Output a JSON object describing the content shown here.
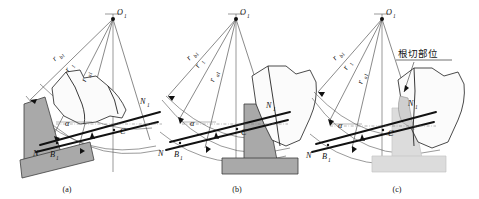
{
  "figure": {
    "background_color": "#ffffff",
    "width": 479,
    "height": 199
  },
  "colors": {
    "rack_dark_fill": "#a9a9a9",
    "rack_light_fill": "#dcdcdc",
    "gear_fill": "#fbfbfb",
    "undercut_fill": "#cfcfcf",
    "line": "#333333",
    "heavy_line": "#111111"
  },
  "captions": [
    {
      "id": "a",
      "text": "(a)"
    },
    {
      "id": "b",
      "text": "(b)"
    },
    {
      "id": "c",
      "text": "(c)"
    }
  ],
  "labels": {
    "center": "O",
    "center_sub": "1",
    "radius_base": "r",
    "radius_base_sub": "b1",
    "radius_pitch": "r",
    "radius_pitch_sub": "1",
    "radius_addendum": "r",
    "radius_addendum_sub": "a1",
    "point_N1": "N",
    "point_N1_sub": "1",
    "point_C": "C",
    "point_N": "N",
    "point_B1": "B",
    "point_B1_sub": "1",
    "angle_alpha": "α"
  },
  "annotation": {
    "undercut_text": "根切部位",
    "undercut_meaning": "undercut region"
  },
  "panels": [
    {
      "id": "a",
      "caption": "(a)",
      "center_label": "O1",
      "rack_shade": "dark",
      "rack_position": "left",
      "radii": [
        "rb1",
        "r1",
        "ra1"
      ],
      "points": [
        "O1",
        "N1",
        "C",
        "N",
        "B1"
      ],
      "angle": "α",
      "has_undercut_annotation": false
    },
    {
      "id": "b",
      "caption": "(b)",
      "center_label": "O1",
      "rack_shade": "dark",
      "rack_position": "center",
      "radii": [
        "rb1",
        "r1",
        "ra1"
      ],
      "points": [
        "O1",
        "N1",
        "C",
        "N",
        "B1"
      ],
      "angle": "α",
      "has_undercut_annotation": false
    },
    {
      "id": "c",
      "caption": "(c)",
      "center_label": "O1",
      "rack_shade": "light",
      "rack_position": "right",
      "radii": [
        "rb1",
        "r1",
        "ra1"
      ],
      "points": [
        "O1",
        "N1",
        "C",
        "N",
        "B1"
      ],
      "angle": "α",
      "has_undercut_annotation": true,
      "annotation_text": "根切部位"
    }
  ]
}
